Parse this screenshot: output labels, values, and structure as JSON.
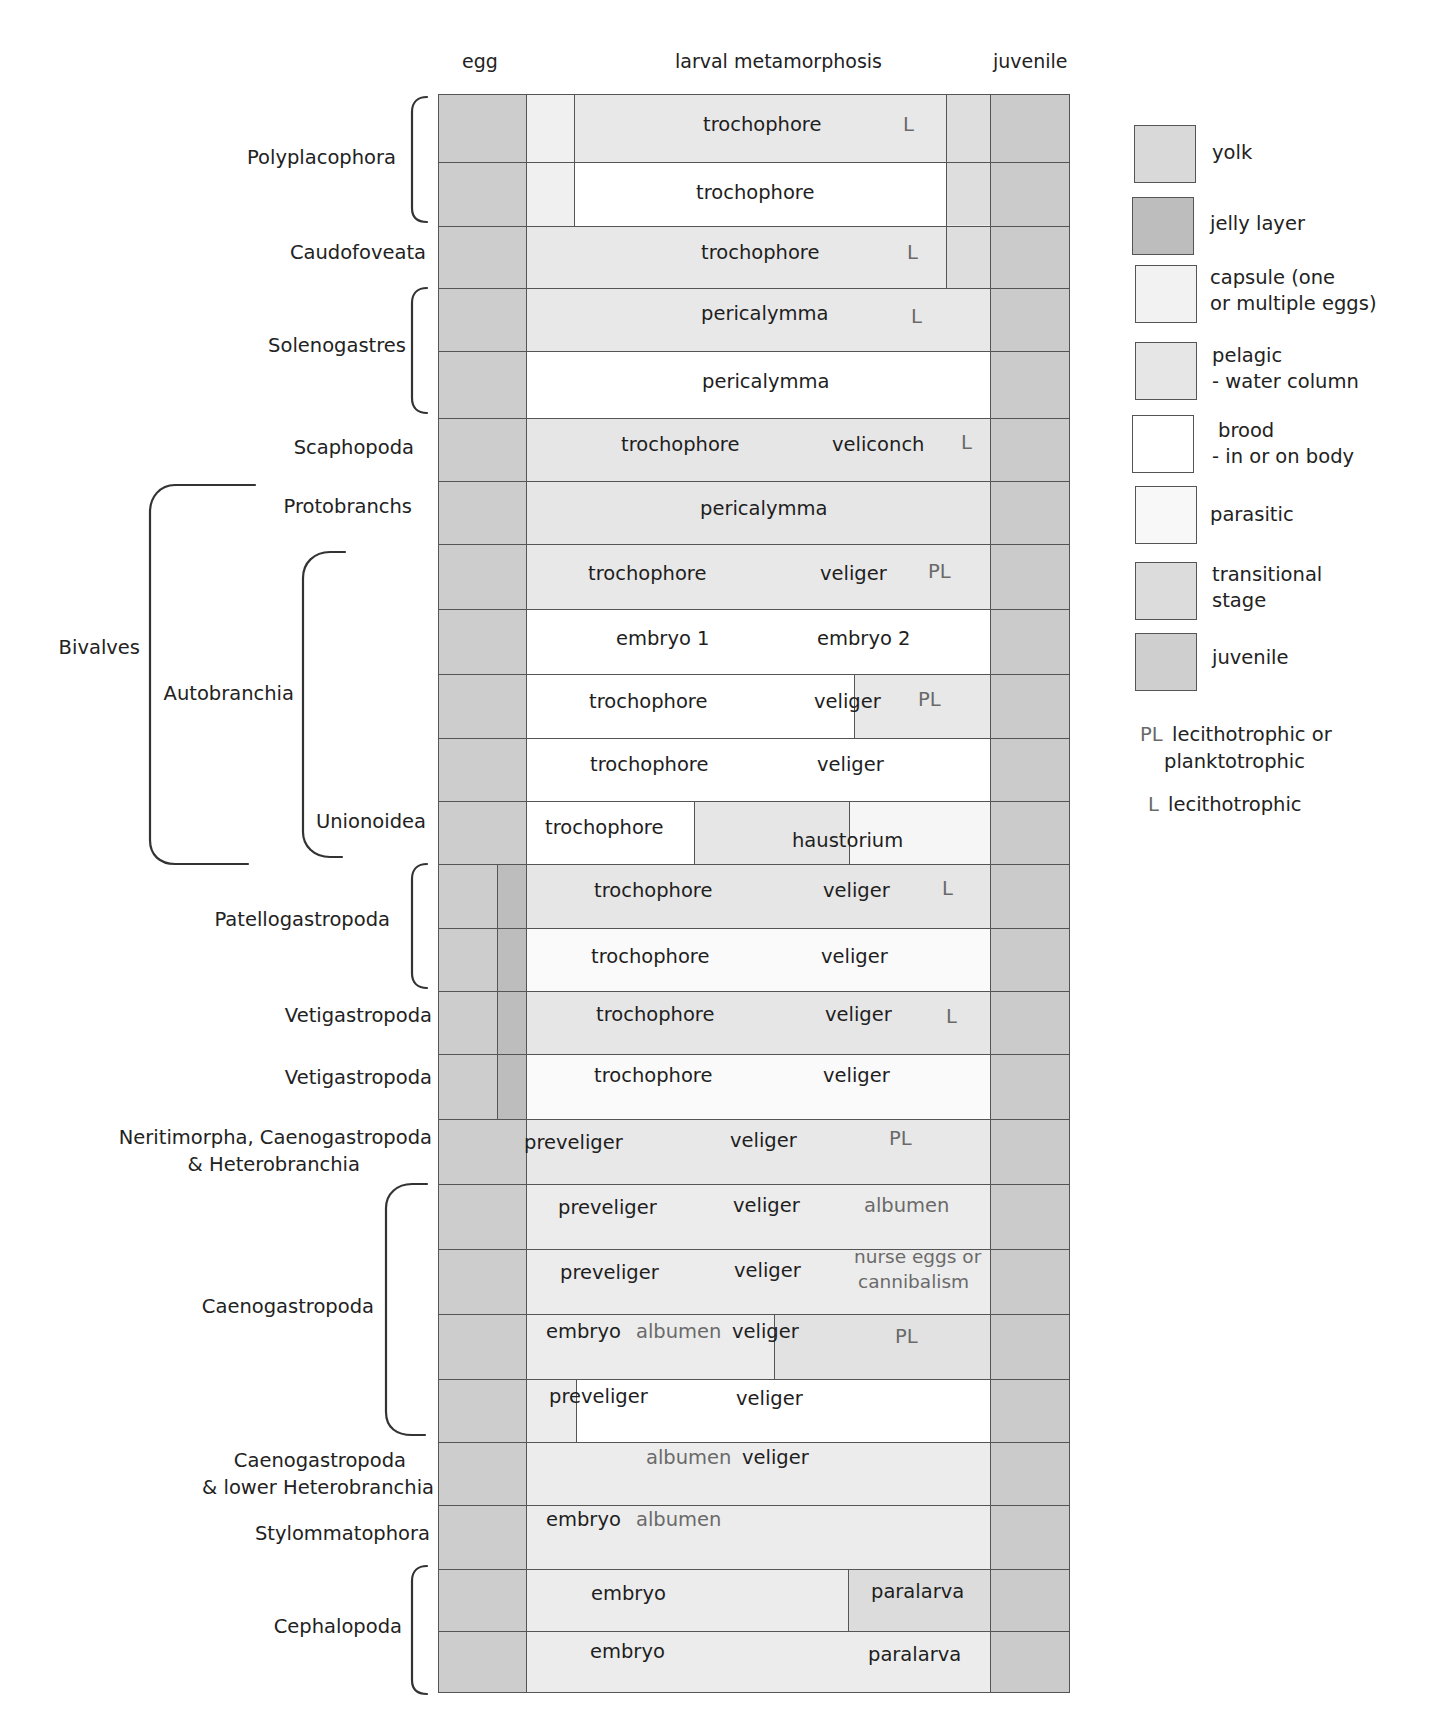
{
  "column_headers": {
    "egg": "egg",
    "larval": "larval metamorphosis",
    "juvenile": "juvenile"
  },
  "colors": {
    "yolk": "#d9d9d9",
    "jelly_layer": "#bdbdbd",
    "capsule": "#f2f2f2",
    "pelagic": "#e6e6e6",
    "brood": "#ffffff",
    "parasitic": "#f8f8f8",
    "transitional": "#dcdcdc",
    "juvenile": "#cfcfcf",
    "line": "#555555"
  },
  "taxa": {
    "polyplacophora": "Polyplacophora",
    "caudofoveata": "Caudofoveata",
    "solenogastres": "Solenogastres",
    "scaphopoda": "Scaphopoda",
    "protobranchs": "Protobranchs",
    "bivalves": "Bivalves",
    "autobranchia": "Autobranchia",
    "unionoidea": "Unionoidea",
    "patellogastropoda": "Patellogastropoda",
    "vetigastropoda_1": "Vetigastropoda",
    "vetigastropoda_2": "Vetigastropoda",
    "neritimorpha_line1": "Neritimorpha, Caenogastropoda",
    "neritimorpha_line2": "& Heterobranchia",
    "caenogastropoda": "Caenogastropoda",
    "caeno_lower_line1": "Caenogastropoda",
    "caeno_lower_line2": "& lower Heterobranchia",
    "stylommatophora": "Stylommatophora",
    "cephalopoda": "Cephalopoda"
  },
  "rows": [
    {
      "labels": [
        "trochophore",
        "L"
      ]
    },
    {
      "labels": [
        "trochophore"
      ]
    },
    {
      "labels": [
        "trochophore",
        "L"
      ]
    },
    {
      "labels": [
        "pericalymma",
        "L"
      ]
    },
    {
      "labels": [
        "pericalymma"
      ]
    },
    {
      "labels": [
        "trochophore",
        "veliconch",
        "L"
      ]
    },
    {
      "labels": [
        "pericalymma"
      ]
    },
    {
      "labels": [
        "trochophore",
        "veliger",
        "PL"
      ]
    },
    {
      "labels": [
        "embryo 1",
        "embryo 2"
      ]
    },
    {
      "labels": [
        "trochophore",
        "veliger",
        "PL"
      ]
    },
    {
      "labels": [
        "trochophore",
        "veliger"
      ]
    },
    {
      "labels": [
        "trochophore",
        "haustorium"
      ]
    },
    {
      "labels": [
        "trochophore",
        "veliger",
        "L"
      ]
    },
    {
      "labels": [
        "trochophore",
        "veliger"
      ]
    },
    {
      "labels": [
        "trochophore",
        "veliger",
        "L"
      ]
    },
    {
      "labels": [
        "trochophore",
        "veliger"
      ]
    },
    {
      "labels": [
        "preveliger",
        "veliger",
        "PL"
      ]
    },
    {
      "labels": [
        "preveliger",
        "veliger",
        "albumen"
      ]
    },
    {
      "labels": [
        "preveliger",
        "veliger",
        "nurse eggs or",
        "cannibalism"
      ]
    },
    {
      "labels": [
        "embryo",
        "albumen",
        "veliger",
        "PL"
      ]
    },
    {
      "labels": [
        "preveliger",
        "veliger"
      ]
    },
    {
      "labels": [
        "albumen",
        "veliger"
      ]
    },
    {
      "labels": [
        "embryo",
        "albumen"
      ]
    },
    {
      "labels": [
        "embryo",
        "paralarva"
      ]
    },
    {
      "labels": [
        "embryo",
        "paralarva"
      ]
    }
  ],
  "legend": {
    "items": [
      {
        "key": "yolk",
        "label_1": "yolk",
        "label_2": ""
      },
      {
        "key": "jelly_layer",
        "label_1": "jelly layer",
        "label_2": ""
      },
      {
        "key": "capsule",
        "label_1": "capsule (one",
        "label_2": "or multiple eggs)"
      },
      {
        "key": "pelagic",
        "label_1": "pelagic",
        "label_2": "- water column"
      },
      {
        "key": "brood",
        "label_1": " brood",
        "label_2": "- in or on body"
      },
      {
        "key": "parasitic",
        "label_1": "parasitic",
        "label_2": ""
      },
      {
        "key": "transitional",
        "label_1": "transitional",
        "label_2": "stage"
      },
      {
        "key": "juvenile",
        "label_1": "juvenile",
        "label_2": ""
      }
    ],
    "pl_code": "PL",
    "pl_text_1": "lecithotrophic or",
    "pl_text_2": "planktotrophic",
    "l_code": "L",
    "l_text": "lecithotrophic"
  }
}
